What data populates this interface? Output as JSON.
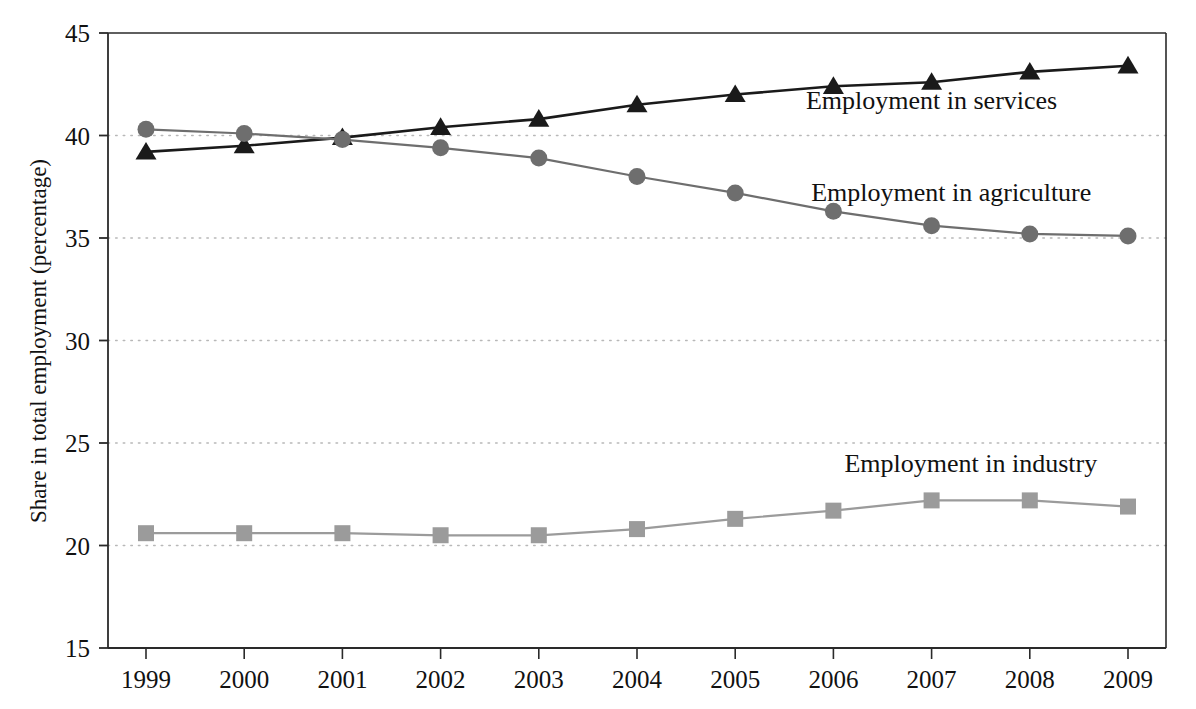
{
  "chart_data": {
    "type": "line",
    "title": "",
    "subtitle": "",
    "xlabel": "",
    "ylabel": "Share in total employment (percentage)",
    "categories": [
      "1999",
      "2000",
      "2001",
      "2002",
      "2003",
      "2004",
      "2005",
      "2006",
      "2007",
      "2008",
      "2009"
    ],
    "x": [
      1999,
      2000,
      2001,
      2002,
      2003,
      2004,
      2005,
      2006,
      2007,
      2008,
      2009
    ],
    "xlim": [
      1999,
      2009
    ],
    "ylim": [
      15,
      45
    ],
    "yticks": [
      15,
      20,
      25,
      30,
      35,
      40,
      45
    ],
    "ytick_labels": [
      "15",
      "20",
      "25",
      "30",
      "35",
      "40",
      "45"
    ],
    "grid": "horizontal-dotted",
    "legend_position": "inline-annotations",
    "series": [
      {
        "name": "Employment in services",
        "marker": "triangle",
        "color": "#1a1a1a",
        "line_color": "#1a1a1a",
        "annotation": "Employment in services",
        "values": [
          39.2,
          39.5,
          39.9,
          40.4,
          40.8,
          41.5,
          42.0,
          42.4,
          42.6,
          43.1,
          43.4
        ]
      },
      {
        "name": "Employment in agriculture",
        "marker": "circle",
        "color": "#6e6e6e",
        "line_color": "#6e6e6e",
        "annotation": "Employment in agriculture",
        "values": [
          40.3,
          40.1,
          39.8,
          39.4,
          38.9,
          38.0,
          37.2,
          36.3,
          35.6,
          35.2,
          35.1
        ]
      },
      {
        "name": "Employment in industry",
        "marker": "square",
        "color": "#9b9b9b",
        "line_color": "#9b9b9b",
        "annotation": "Employment in industry",
        "values": [
          20.6,
          20.6,
          20.6,
          20.5,
          20.5,
          20.8,
          21.3,
          21.7,
          22.2,
          22.2,
          21.9
        ]
      }
    ],
    "annotations": [
      {
        "text": "Employment in services",
        "x_year": 2007.0,
        "y_value": 41.3
      },
      {
        "text": "Employment in agriculture",
        "x_year": 2007.2,
        "y_value": 36.8
      },
      {
        "text": "Employment in industry",
        "x_year": 2007.4,
        "y_value": 23.6
      }
    ],
    "colors": {
      "services": "#1a1a1a",
      "agriculture": "#6e6e6e",
      "industry": "#9b9b9b",
      "grid": "#b8b8b8",
      "axis": "#2a2a2a",
      "background": "#ffffff"
    }
  }
}
